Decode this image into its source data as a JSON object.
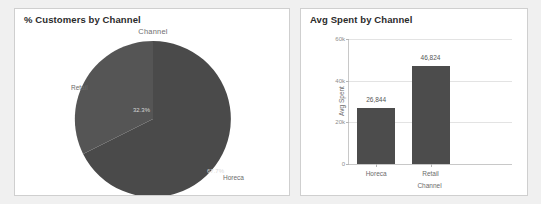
{
  "page": {
    "background_color": "#f0f0f0"
  },
  "panels": {
    "left": {
      "title": "% Customers by Channel"
    },
    "right": {
      "title": "Avg Spent by Channel"
    }
  },
  "chart_data": [
    {
      "type": "pie",
      "title": "Channel",
      "panel_title": "% Customers by Channel",
      "categories": [
        "Horeca",
        "Retail"
      ],
      "values": [
        67.7,
        32.3
      ],
      "value_labels": [
        "67.7%",
        "32.3%"
      ],
      "colors": [
        "#4a4a4a",
        "#555555"
      ],
      "start_angle_deg": 0,
      "direction": "clockwise",
      "legend": "none",
      "label_position": "outside",
      "labels": {
        "horeca": "Horeca",
        "retail": "Retail"
      }
    },
    {
      "type": "bar",
      "title": "",
      "panel_title": "Avg Spent by Channel",
      "categories": [
        "Horeca",
        "Retail"
      ],
      "values": [
        26844,
        46824
      ],
      "value_labels": [
        "26,844",
        "46,824"
      ],
      "xlabel": "Channel",
      "ylabel": "Avg Spent",
      "ylim": [
        0,
        60000
      ],
      "yticks": [
        0,
        20000,
        40000,
        60000
      ],
      "ytick_labels": [
        "0",
        "20k",
        "40k",
        "60k"
      ],
      "bar_color": "#4c4c4c",
      "grid": true,
      "grid_axis": "y",
      "legend": "none"
    }
  ]
}
